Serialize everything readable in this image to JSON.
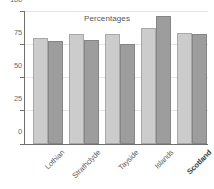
{
  "chart_data": {
    "type": "bar",
    "title": "Percentages",
    "xlabel": "",
    "ylabel": "",
    "ylim": [
      0,
      100
    ],
    "yticks": [
      0,
      25,
      50,
      75,
      100
    ],
    "ytick_labels": [
      "0",
      "25",
      "50",
      "75",
      "100"
    ],
    "grid": true,
    "legend": "none",
    "categories": [
      "Lothian",
      "Strathclyde",
      "Tayside",
      "Islands",
      "Scotland"
    ],
    "series": [
      {
        "name": "series-1",
        "color": "#cccccc",
        "values": [
          80,
          83,
          83,
          87,
          83.5
        ]
      },
      {
        "name": "series-2",
        "color": "#9d9d9d",
        "values": [
          77.5,
          78,
          75.5,
          96.5,
          82.5
        ]
      }
    ],
    "emphasized_category": "Scotland"
  },
  "axis": {
    "tick_color": "#6f6f6f",
    "grid_color": "#e6e6e6",
    "label_color": "#6a6a6a"
  }
}
